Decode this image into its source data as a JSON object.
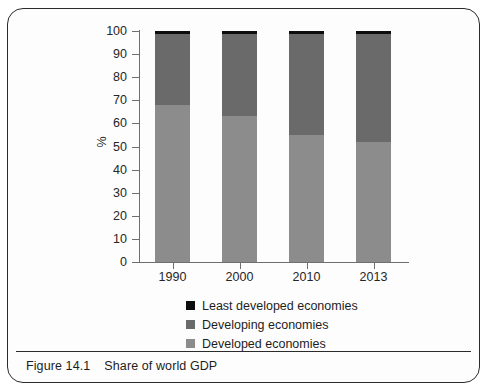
{
  "figure": {
    "caption_number": "Figure 14.1",
    "caption_text": "Share of world GDP"
  },
  "colors": {
    "developed": "#8c8c8c",
    "developing": "#6a6a6a",
    "least_developed": "#0d0d0d",
    "axis": "#6f6f6f",
    "frame": "#2b2b2b",
    "text": "#1d1d1d"
  },
  "chart_data": {
    "type": "bar",
    "subtype": "stacked-percentage",
    "title": "Share of world GDP",
    "xlabel": "",
    "ylabel": "%",
    "ylim": [
      0,
      100
    ],
    "yticks": [
      0,
      10,
      20,
      30,
      40,
      50,
      60,
      70,
      80,
      90,
      100
    ],
    "ytick_labels": [
      "0",
      "10",
      "20",
      "30",
      "40",
      "50",
      "60",
      "70",
      "80",
      "90",
      "100"
    ],
    "grid": false,
    "legend_position": "below-plot",
    "categories": [
      "1990",
      "2000",
      "2010",
      "2013"
    ],
    "series": [
      {
        "name": "Developed economies",
        "color": "#8c8c8c",
        "values": [
          68,
          63,
          55,
          52
        ]
      },
      {
        "name": "Developing economies",
        "color": "#6a6a6a",
        "values": [
          30.5,
          35.5,
          43.5,
          46.5
        ]
      },
      {
        "name": "Least developed economies",
        "color": "#0d0d0d",
        "values": [
          1.5,
          1.5,
          1.5,
          1.5
        ]
      }
    ],
    "legend_order": [
      "Least developed economies",
      "Developing economies",
      "Developed economies"
    ]
  }
}
